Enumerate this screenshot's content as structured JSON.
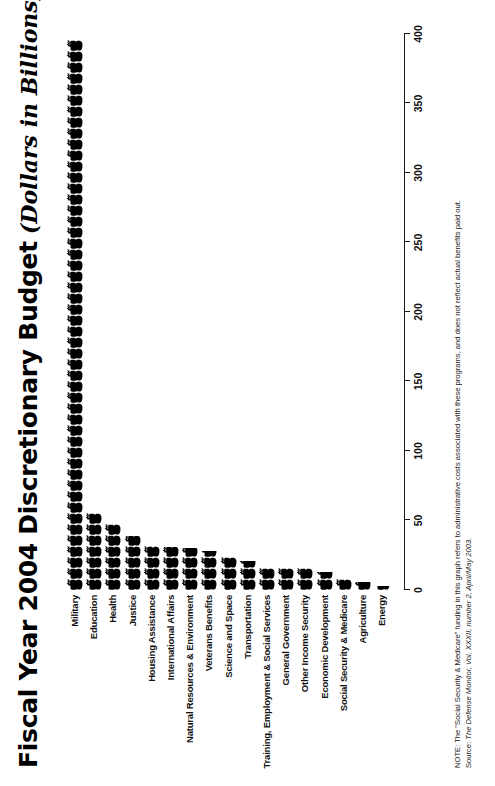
{
  "title": {
    "main": "Fiscal Year 2004 Discretionary Budget",
    "sub": "(Dollars in Billions)"
  },
  "notes": {
    "note": "NOTE: The \"Social Security & Medicare\" funding in this graph refers to administrative costs associated with these programs, and does not reflect actual benefits paid out.",
    "source_lead": "Source: ",
    "source_text": "The Defense Monitor, Vol. XXXII, number 2, April/May 2003."
  },
  "axis": {
    "ticks": [
      0,
      50,
      100,
      150,
      200,
      250,
      300,
      350,
      400
    ],
    "min": 0,
    "max": 400
  },
  "icon": {
    "name": "tank-icon",
    "color": "#000000"
  },
  "chart_data": {
    "type": "bar",
    "orientation": "horizontal",
    "xlabel": "",
    "ylabel": "",
    "xlim": [
      0,
      400
    ],
    "grid": false,
    "legend": null,
    "units": "billions of dollars",
    "categories": [
      "Military",
      "Education",
      "Health",
      "Justice",
      "Housing Assistance",
      "International Affairs",
      "Natural Resources & Environment",
      "Veterans Benefits",
      "Science and Space",
      "Transportation",
      "Training, Employment & Social Services",
      "General Government",
      "Other Income Security",
      "Economic Development",
      "Social Security & Medicare",
      "Agriculture",
      "Energy"
    ],
    "values": [
      399,
      57,
      49,
      39,
      32,
      31,
      30,
      28,
      24,
      21,
      19,
      17,
      16,
      13,
      11,
      6,
      3
    ]
  }
}
